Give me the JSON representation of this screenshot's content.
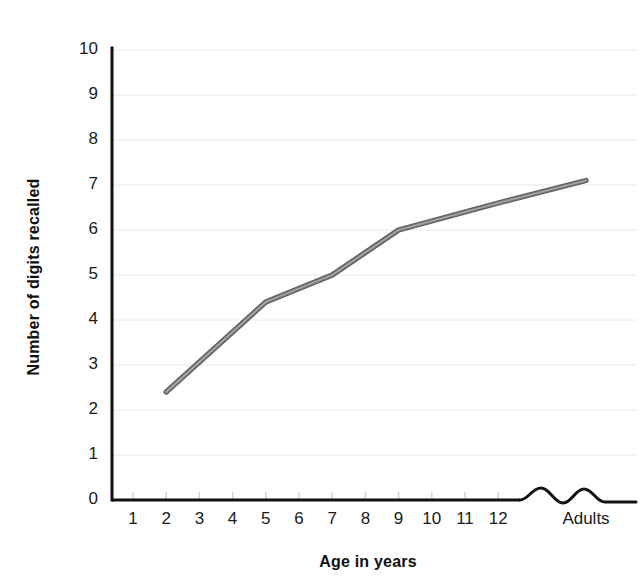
{
  "chart_data": {
    "type": "line",
    "title": "",
    "subtitle": "",
    "xlabel": "Age in years",
    "ylabel": "Number of digits recalled",
    "x_tick_labels": [
      "1",
      "2",
      "3",
      "4",
      "5",
      "6",
      "7",
      "8",
      "9",
      "10",
      "11",
      "12",
      "Adults"
    ],
    "y_tick_labels": [
      "0",
      "1",
      "2",
      "3",
      "4",
      "5",
      "6",
      "7",
      "8",
      "9",
      "10"
    ],
    "ylim": [
      0,
      10
    ],
    "y_tick_step": 1,
    "grid": "horizontal",
    "legend": "none",
    "axis_break": {
      "present": true,
      "style": "wavy-squiggle",
      "between": [
        "12",
        "Adults"
      ],
      "axis": "x"
    },
    "series": [
      {
        "name": "Digits recalled",
        "color": "#808080",
        "line_width": 4,
        "markers": "none",
        "x": [
          "2",
          "5",
          "7",
          "9",
          "12",
          "Adults"
        ],
        "values": [
          2.4,
          4.4,
          5.0,
          6.0,
          6.6,
          7.1
        ]
      }
    ],
    "annotations": []
  },
  "axes": {
    "y_title": "Number of digits recalled",
    "x_title": "Age in years"
  },
  "colors": {
    "line": "#808080",
    "line_edge": "#5a5a5a",
    "axis": "#111111",
    "grid": "#e8e8e8",
    "background": "#ffffff",
    "text": "#1a1a1a"
  }
}
